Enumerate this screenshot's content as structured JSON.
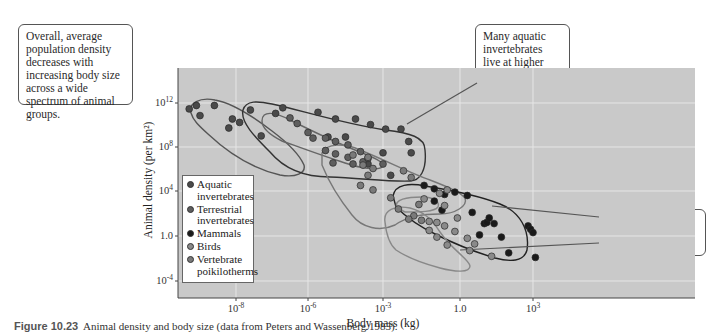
{
  "callouts": {
    "overall": "Overall, average population density decreases with increasing body size across a wide spectrum of animal groups.",
    "aquatic": "Many aquatic invertebrates live at higher population densities than other animals of comparable size.",
    "mammals": "Mammals tend to live at higher population densities than birds."
  },
  "caption": {
    "label": "Figure 10.23",
    "text": "Animal density and body size (data from Peters and Wassenberg 1983)."
  },
  "colors": {
    "plot_bg": "#c9c9c9",
    "grid": "#e6e6e6",
    "aquatic": "#4a4a4a",
    "terrestrial": "#5e5e5e",
    "mammals": "#1a1a1a",
    "birds": "#8a8a8a",
    "poikilotherms": "#7a7a7a"
  },
  "chart_data": {
    "type": "scatter",
    "title": "",
    "xlabel": "Body mass (kg)",
    "ylabel": "Animal density (per km²)",
    "x_scale": "log",
    "y_scale": "log",
    "xticks": [
      "10⁻⁸",
      "10⁻⁶",
      "10⁻³",
      "1.0",
      "10³"
    ],
    "yticks": [
      "10¹²",
      "10⁸",
      "10⁴",
      "1.0",
      "10⁻⁴"
    ],
    "grid": true,
    "legend_position": "lower-left inside",
    "legend": [
      "Aquatic invertebrates",
      "Terrestrial invertebrates",
      "Mammals",
      "Birds",
      "Vertebrate poikilotherms"
    ],
    "series": [
      {
        "name": "Aquatic invertebrates",
        "points_log10": [
          [
            -9.3,
            11.3
          ],
          [
            -9.1,
            11.6
          ],
          [
            -9.0,
            10.7
          ],
          [
            -8.6,
            11.6
          ],
          [
            -8.1,
            10.4
          ],
          [
            -7.9,
            10.1
          ],
          [
            -7.6,
            11.2
          ],
          [
            -7.3,
            8.9
          ],
          [
            -8.2,
            9.6
          ],
          [
            -6.9,
            10.9
          ],
          [
            -6.7,
            11.4
          ],
          [
            -5.6,
            11.0
          ],
          [
            -4.9,
            10.4
          ],
          [
            -4.1,
            10.4
          ],
          [
            -3.5,
            9.9
          ],
          [
            -2.9,
            9.5
          ],
          [
            -2.3,
            9.5
          ],
          [
            -1.9,
            7.4
          ],
          [
            -2.0,
            8.4
          ],
          [
            -3.0,
            7.4
          ],
          [
            -5.2,
            8.8
          ],
          [
            -4.5,
            8.8
          ],
          [
            -3.6,
            6.4
          ],
          [
            -2.7,
            5.4
          ]
        ]
      },
      {
        "name": "Terrestrial invertebrates",
        "points_log10": [
          [
            -6.5,
            10.5
          ],
          [
            -6.3,
            10.0
          ],
          [
            -6.0,
            9.2
          ],
          [
            -5.8,
            8.7
          ],
          [
            -5.3,
            8.7
          ],
          [
            -5.3,
            7.6
          ],
          [
            -4.9,
            8.4
          ],
          [
            -4.4,
            8.1
          ],
          [
            -4.4,
            7.0
          ],
          [
            -3.8,
            6.6
          ],
          [
            -3.6,
            6.9
          ],
          [
            -4.2,
            6.4
          ],
          [
            -5.0,
            6.5
          ],
          [
            -3.9,
            7.5
          ],
          [
            -3.0,
            6.4
          ],
          [
            -4.9,
            7.3
          ]
        ]
      },
      {
        "name": "Mammals",
        "points_log10": [
          [
            -1.4,
            4.5
          ],
          [
            -1.0,
            4.2
          ],
          [
            -1.0,
            3.1
          ],
          [
            -0.7,
            2.3
          ],
          [
            -0.2,
            3.9
          ],
          [
            0.5,
            2.1
          ],
          [
            1.0,
            1.1
          ],
          [
            1.1,
            1.2
          ],
          [
            1.2,
            1.6
          ],
          [
            1.4,
            1.1
          ],
          [
            2.0,
            -1.5
          ],
          [
            3.1,
            -1.9
          ],
          [
            2.8,
            0.9
          ],
          [
            2.9,
            0.6
          ],
          [
            3.0,
            0.3
          ],
          [
            1.7,
            -0.1
          ],
          [
            0.3,
            3.6
          ],
          [
            0.8,
            0.1
          ],
          [
            -0.6,
            3.7
          ]
        ]
      },
      {
        "name": "Birds",
        "points_log10": [
          [
            -0.8,
            3.8
          ],
          [
            -0.5,
            4.1
          ],
          [
            -0.6,
            2.7
          ],
          [
            -1.4,
            3.3
          ],
          [
            -1.2,
            1.3
          ],
          [
            -0.9,
            1.2
          ],
          [
            -0.6,
            0.9
          ],
          [
            -0.2,
            0.4
          ],
          [
            0.3,
            -0.2
          ],
          [
            0.6,
            -0.7
          ],
          [
            -0.5,
            -0.8
          ],
          [
            -0.9,
            -0.1
          ],
          [
            -1.2,
            0.5
          ],
          [
            -0.1,
            1.6
          ],
          [
            0.4,
            -1.3
          ],
          [
            1.3,
            -1.8
          ]
        ]
      },
      {
        "name": "Vertebrate poikilotherms",
        "points_log10": [
          [
            -4.2,
            7.2
          ],
          [
            -3.6,
            7.0
          ],
          [
            -3.8,
            6.3
          ],
          [
            -3.6,
            5.4
          ],
          [
            -3.9,
            4.5
          ],
          [
            -3.4,
            4.1
          ],
          [
            -2.7,
            3.4
          ],
          [
            -2.4,
            2.4
          ],
          [
            -1.6,
            2.8
          ],
          [
            -1.8,
            1.8
          ],
          [
            -2.0,
            1.5
          ],
          [
            -1.5,
            1.4
          ],
          [
            -3.4,
            6.0
          ],
          [
            -2.2,
            5.8
          ],
          [
            -1.9,
            5.2
          ]
        ]
      }
    ]
  }
}
